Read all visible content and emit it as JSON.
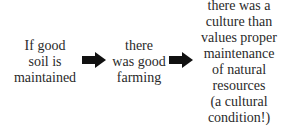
{
  "diagram": {
    "type": "flow",
    "direction": "left-to-right",
    "nodes": [
      {
        "id": "b1",
        "lines": [
          "If good",
          "soil is",
          "maintained"
        ]
      },
      {
        "id": "b2",
        "lines": [
          "there",
          "was good",
          "farming"
        ]
      },
      {
        "id": "b3",
        "lines": [
          "there was a",
          "culture than",
          "values proper",
          "maintenance",
          "of natural",
          "resources",
          "(a cultural",
          "condition!)"
        ]
      }
    ],
    "edges": [
      {
        "from": "b1",
        "to": "b2",
        "icon": "block-arrow-right"
      },
      {
        "from": "b2",
        "to": "b3",
        "icon": "block-arrow-right"
      }
    ],
    "colors": {
      "text": "#2a2a2a",
      "arrow": "#111111",
      "background": "#ffffff"
    }
  }
}
